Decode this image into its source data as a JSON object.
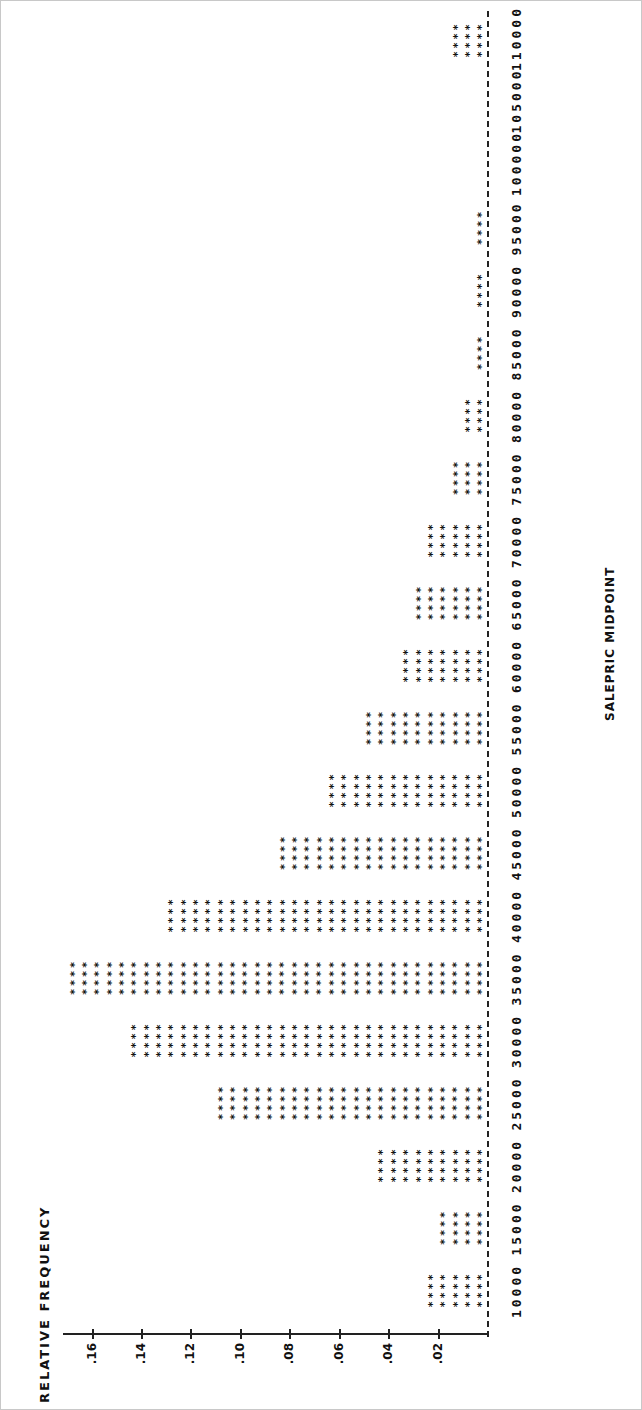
{
  "chart_data": {
    "type": "bar",
    "orientation": "rotated-90deg (printed histogram)",
    "title": "",
    "xlabel": "SALEPRIC MIDPOINT",
    "ylabel": "RELATIVE FREQUENCY",
    "categories": [
      "10000",
      "15000",
      "20000",
      "25000",
      "30000",
      "35000",
      "40000",
      "45000",
      "50000",
      "55000",
      "60000",
      "65000",
      "70000",
      "75000",
      "80000",
      "85000",
      "90000",
      "95000",
      "100000",
      "105000",
      "110000"
    ],
    "star_counts": [
      5,
      4,
      9,
      22,
      29,
      34,
      26,
      17,
      13,
      10,
      7,
      6,
      5,
      3,
      2,
      1,
      1,
      1,
      0,
      0,
      3
    ],
    "values": [
      0.025,
      0.02,
      0.045,
      0.11,
      0.145,
      0.17,
      0.13,
      0.085,
      0.065,
      0.05,
      0.035,
      0.03,
      0.025,
      0.015,
      0.01,
      0.005,
      0.005,
      0.005,
      0,
      0,
      0.015
    ],
    "star_unit": 0.005,
    "yticks": [
      ".02",
      ".04",
      ".06",
      ".08",
      ".10",
      ".12",
      ".14",
      ".16"
    ],
    "ylim": [
      0,
      0.17
    ],
    "grid": false,
    "legend": null,
    "bar_glyph": "*"
  }
}
